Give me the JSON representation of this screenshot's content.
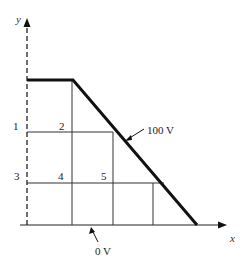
{
  "diagram": {
    "axes": {
      "x_label": "x",
      "y_label": "y"
    },
    "node_labels": [
      {
        "id": "1",
        "text": "1"
      },
      {
        "id": "2",
        "text": "2"
      },
      {
        "id": "3",
        "text": "3"
      },
      {
        "id": "4",
        "text": "4"
      },
      {
        "id": "5",
        "text": "5"
      }
    ],
    "boundaries": [
      {
        "name": "high-potential-boundary",
        "label": "100 V"
      },
      {
        "name": "ground-boundary",
        "label": "0 V"
      }
    ],
    "colors": {
      "line": "#111111",
      "grid": "#333333",
      "background": "#ffffff"
    }
  }
}
